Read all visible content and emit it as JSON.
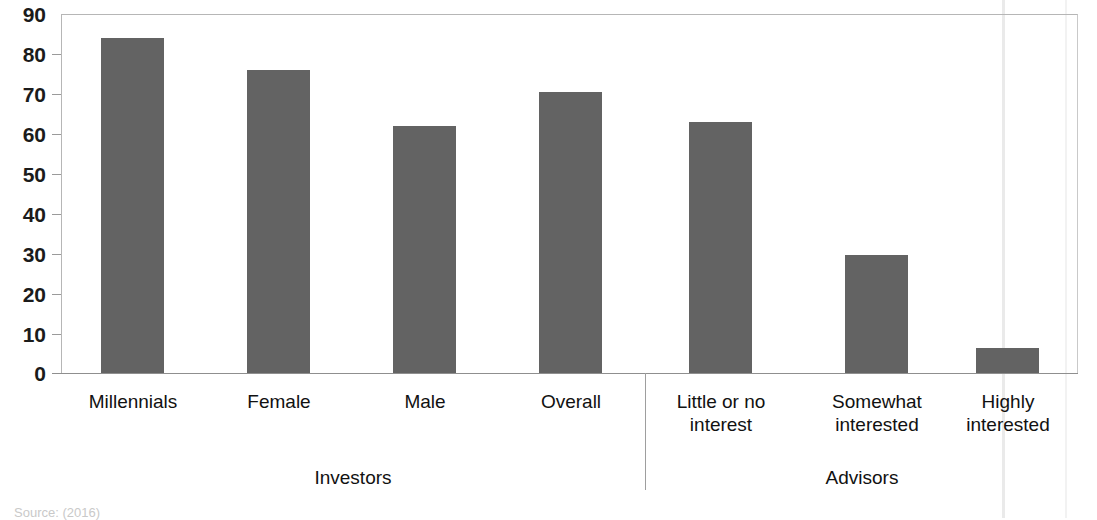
{
  "chart_data": {
    "type": "bar",
    "title": "",
    "xlabel": "",
    "ylabel": "",
    "ylim": [
      0,
      90
    ],
    "grid": false,
    "legend": "none",
    "y_ticks": [
      90,
      80,
      70,
      60,
      50,
      40,
      30,
      20,
      10,
      0
    ],
    "categories": [
      "Millennials",
      "Female",
      "Male",
      "Overall",
      "Little or no interest",
      "Somewhat interested",
      "Highly interested"
    ],
    "values": [
      84,
      76,
      62,
      70.5,
      63,
      29.5,
      6.3
    ],
    "groups": [
      {
        "label": "Investors",
        "categories": [
          "Millennials",
          "Female",
          "Male",
          "Overall"
        ]
      },
      {
        "label": "Advisors",
        "categories": [
          "Little or no interest",
          "Somewhat interested",
          "Highly interested"
        ]
      }
    ],
    "bar_color": "#636363",
    "axis_color": "#9a9a9a"
  },
  "axis": {
    "ticks": [
      {
        "value": "90"
      },
      {
        "value": "80"
      },
      {
        "value": "70"
      },
      {
        "value": "60"
      },
      {
        "value": "50"
      },
      {
        "value": "40"
      },
      {
        "value": "30"
      },
      {
        "value": "20"
      },
      {
        "value": "10"
      },
      {
        "value": "0"
      }
    ]
  },
  "bars": [
    {
      "label_line1": "Millennials",
      "label_line2": "",
      "value": 84
    },
    {
      "label_line1": "Female",
      "label_line2": "",
      "value": 76
    },
    {
      "label_line1": "Male",
      "label_line2": "",
      "value": 62
    },
    {
      "label_line1": "Overall",
      "label_line2": "",
      "value": 70.5
    },
    {
      "label_line1": "Little or no",
      "label_line2": "interest",
      "value": 63
    },
    {
      "label_line1": "Somewhat",
      "label_line2": "interested",
      "value": 29.5
    },
    {
      "label_line1": "Highly",
      "label_line2": "interested",
      "value": 6.3
    }
  ],
  "groups": [
    {
      "label": "Investors"
    },
    {
      "label": "Advisors"
    }
  ],
  "footer": {
    "source": "Source: (2016)"
  }
}
